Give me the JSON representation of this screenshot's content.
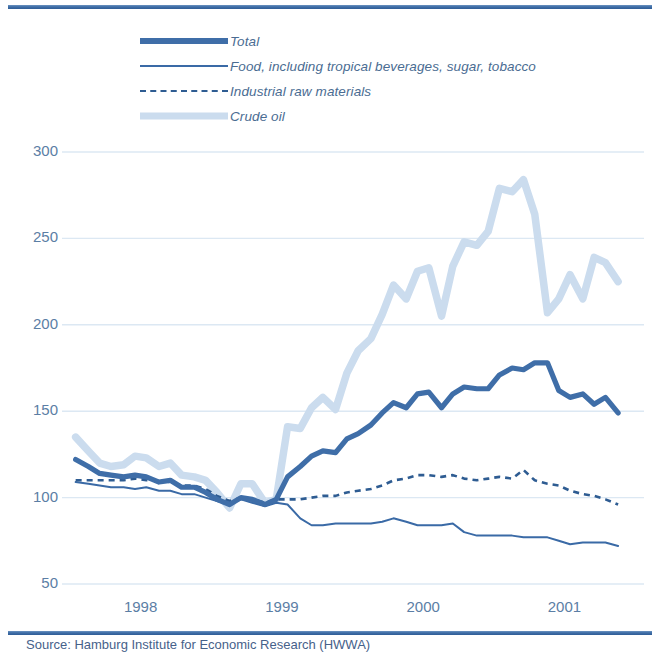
{
  "figure": {
    "source_note": "Source: Hamburg Institute for Economic Research (HWWA)",
    "colors": {
      "total": "#3f6ea8",
      "food": "#3a6aa6",
      "industrial": "#2e5c92",
      "crude_oil": "#cbdcee",
      "axis_text": "#5b7ea5",
      "gridline": "#dce8f3",
      "rule": "#3f6ea8"
    }
  },
  "legend": {
    "items": [
      {
        "label": "Total",
        "style": "thick-solid",
        "swatch": "legend-swatch-total"
      },
      {
        "label": "Food, including tropical beverages, sugar, tobacco",
        "style": "thin-solid",
        "swatch": "legend-swatch-food"
      },
      {
        "label": "Industrial raw materials",
        "style": "dashed",
        "swatch": "legend-swatch-industrial"
      },
      {
        "label": "Crude oil",
        "style": "thick-light",
        "swatch": "legend-swatch-crude-oil"
      }
    ]
  },
  "chart_data": {
    "type": "line",
    "title": "",
    "subtitle": "",
    "xlabel": "",
    "ylabel": "",
    "grid": true,
    "legend_position": "top",
    "xlim": [
      1997.5,
      2001.45
    ],
    "ylim": [
      50,
      300
    ],
    "yticks": [
      300,
      250,
      200,
      150,
      100,
      50
    ],
    "ytick_labels": [
      "300",
      "250",
      "200",
      "150",
      "100",
      "50"
    ],
    "xticks": [
      1998,
      1999,
      2000,
      2001
    ],
    "xtick_labels": [
      "1998",
      "1999",
      "2000",
      "2001"
    ],
    "x": [
      1997.54,
      1997.63,
      1997.71,
      1997.79,
      1997.88,
      1997.96,
      1998.04,
      1998.13,
      1998.21,
      1998.29,
      1998.38,
      1998.46,
      1998.54,
      1998.63,
      1998.71,
      1998.79,
      1998.88,
      1998.96,
      1999.04,
      1999.13,
      1999.21,
      1999.29,
      1999.38,
      1999.46,
      1999.54,
      1999.63,
      1999.71,
      1999.79,
      1999.88,
      1999.96,
      2000.04,
      2000.13,
      2000.21,
      2000.29,
      2000.38,
      2000.46,
      2000.54,
      2000.63,
      2000.71,
      2000.79,
      2000.88,
      2000.96,
      2001.04,
      2001.13,
      2001.21,
      2001.29,
      2001.38
    ],
    "series": [
      {
        "name": "Total",
        "key": "total",
        "color": "#3f6ea8",
        "style": "thick-solid",
        "values": [
          122,
          118,
          114,
          113,
          112,
          113,
          112,
          109,
          110,
          106,
          106,
          103,
          99,
          96,
          100,
          99,
          96,
          99,
          112,
          118,
          124,
          127,
          126,
          134,
          137,
          142,
          149,
          155,
          152,
          160,
          161,
          152,
          160,
          164,
          163,
          163,
          171,
          175,
          174,
          178,
          178,
          162,
          158,
          160,
          154,
          158,
          149
        ]
      },
      {
        "name": "Food, including tropical beverages, sugar, tobacco",
        "key": "food",
        "color": "#3a6aa6",
        "style": "thin-solid",
        "values": [
          109,
          108,
          107,
          106,
          106,
          105,
          106,
          104,
          104,
          102,
          102,
          100,
          98,
          96,
          99,
          97,
          95,
          97,
          96,
          88,
          84,
          84,
          85,
          85,
          85,
          85,
          86,
          88,
          86,
          84,
          84,
          84,
          85,
          80,
          78,
          78,
          78,
          78,
          77,
          77,
          77,
          75,
          73,
          74,
          74,
          74,
          72
        ]
      },
      {
        "name": "Industrial raw materials",
        "key": "industrial",
        "color": "#2e5c92",
        "style": "dashed",
        "values": [
          110,
          110,
          110,
          110,
          110,
          111,
          110,
          110,
          109,
          107,
          107,
          105,
          101,
          98,
          100,
          99,
          97,
          99,
          99,
          99,
          100,
          101,
          101,
          103,
          104,
          105,
          107,
          110,
          111,
          113,
          113,
          112,
          113,
          111,
          110,
          111,
          112,
          111,
          116,
          110,
          108,
          107,
          104,
          102,
          101,
          99,
          96
        ]
      },
      {
        "name": "Crude oil",
        "key": "crude_oil",
        "color": "#cbdcee",
        "style": "thick-light",
        "values": [
          135,
          127,
          120,
          118,
          119,
          124,
          123,
          118,
          120,
          113,
          112,
          110,
          103,
          94,
          108,
          108,
          97,
          99,
          141,
          140,
          152,
          158,
          151,
          172,
          185,
          192,
          206,
          223,
          215,
          231,
          233,
          205,
          234,
          248,
          246,
          254,
          279,
          277,
          284,
          264,
          207,
          215,
          229,
          215,
          239,
          236,
          225
        ]
      }
    ]
  }
}
